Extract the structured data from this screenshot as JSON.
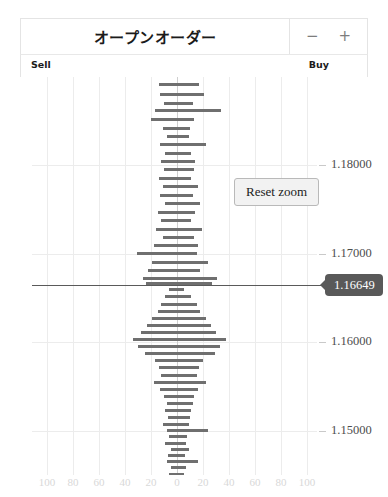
{
  "panel": {
    "title": "オープンオーダー",
    "zoom_out_label": "−",
    "zoom_in_label": "+"
  },
  "sides": {
    "sell_label": "Sell",
    "buy_label": "Buy"
  },
  "actions": {
    "reset_zoom_label": "Reset zoom"
  },
  "current_price": {
    "value": "1.16649",
    "badge_color": "#595959",
    "line_color": "#5a5a5a"
  },
  "chart_data": {
    "type": "bar",
    "orientation": "horizontal-diverging",
    "title": "オープンオーダー",
    "xlabel": "",
    "ylabel": "",
    "grid": true,
    "legend_position": "top",
    "bar_color": "#6f6f6f",
    "gridline_color": "#ececec",
    "ylim": [
      1.145,
      1.19
    ],
    "yticks": [
      "1.18000",
      "1.17000",
      "1.16000",
      "1.15000"
    ],
    "ytick_values": [
      1.18,
      1.17,
      1.16,
      1.15
    ],
    "xlim": [
      -100,
      100
    ],
    "xticks": [
      "100",
      "80",
      "60",
      "40",
      "20",
      "0",
      "20",
      "40",
      "60",
      "80",
      "100"
    ],
    "center_value": 1.16649,
    "series": [
      {
        "name": "Sell",
        "direction": "left"
      },
      {
        "name": "Buy",
        "direction": "right"
      }
    ],
    "bars": [
      {
        "price": 1.1892,
        "sell": 14,
        "buy": 17
      },
      {
        "price": 1.188,
        "sell": 13,
        "buy": 21
      },
      {
        "price": 1.187,
        "sell": 10,
        "buy": 12
      },
      {
        "price": 1.1862,
        "sell": 17,
        "buy": 34
      },
      {
        "price": 1.1852,
        "sell": 20,
        "buy": 13
      },
      {
        "price": 1.1842,
        "sell": 11,
        "buy": 10
      },
      {
        "price": 1.1833,
        "sell": 8,
        "buy": 9
      },
      {
        "price": 1.1824,
        "sell": 13,
        "buy": 22
      },
      {
        "price": 1.1814,
        "sell": 9,
        "buy": 11
      },
      {
        "price": 1.1804,
        "sell": 12,
        "buy": 14
      },
      {
        "price": 1.1795,
        "sell": 10,
        "buy": 13
      },
      {
        "price": 1.1785,
        "sell": 14,
        "buy": 11
      },
      {
        "price": 1.1776,
        "sell": 11,
        "buy": 16
      },
      {
        "price": 1.1766,
        "sell": 13,
        "buy": 12
      },
      {
        "price": 1.1757,
        "sell": 9,
        "buy": 18
      },
      {
        "price": 1.1747,
        "sell": 15,
        "buy": 14
      },
      {
        "price": 1.1738,
        "sell": 12,
        "buy": 11
      },
      {
        "price": 1.1728,
        "sell": 16,
        "buy": 19
      },
      {
        "price": 1.1719,
        "sell": 11,
        "buy": 13
      },
      {
        "price": 1.1709,
        "sell": 18,
        "buy": 16
      },
      {
        "price": 1.17,
        "sell": 31,
        "buy": 15
      },
      {
        "price": 1.169,
        "sell": 19,
        "buy": 24
      },
      {
        "price": 1.1681,
        "sell": 22,
        "buy": 18
      },
      {
        "price": 1.1672,
        "sell": 26,
        "buy": 31
      },
      {
        "price": 1.1666,
        "sell": 24,
        "buy": 27
      },
      {
        "price": 1.166,
        "sell": 6,
        "buy": 5
      },
      {
        "price": 1.1652,
        "sell": 9,
        "buy": 11
      },
      {
        "price": 1.1643,
        "sell": 12,
        "buy": 15
      },
      {
        "price": 1.1635,
        "sell": 15,
        "buy": 18
      },
      {
        "price": 1.1627,
        "sell": 19,
        "buy": 22
      },
      {
        "price": 1.1619,
        "sell": 23,
        "buy": 26
      },
      {
        "price": 1.1611,
        "sell": 28,
        "buy": 30
      },
      {
        "price": 1.1603,
        "sell": 34,
        "buy": 38
      },
      {
        "price": 1.1595,
        "sell": 30,
        "buy": 33
      },
      {
        "price": 1.1587,
        "sell": 25,
        "buy": 29
      },
      {
        "price": 1.1579,
        "sell": 17,
        "buy": 20
      },
      {
        "price": 1.1571,
        "sell": 14,
        "buy": 17
      },
      {
        "price": 1.1563,
        "sell": 12,
        "buy": 15
      },
      {
        "price": 1.1555,
        "sell": 18,
        "buy": 22
      },
      {
        "price": 1.1547,
        "sell": 13,
        "buy": 16
      },
      {
        "price": 1.1539,
        "sell": 10,
        "buy": 13
      },
      {
        "price": 1.1531,
        "sell": 8,
        "buy": 12
      },
      {
        "price": 1.1523,
        "sell": 9,
        "buy": 11
      },
      {
        "price": 1.1515,
        "sell": 7,
        "buy": 10
      },
      {
        "price": 1.1507,
        "sell": 11,
        "buy": 9
      },
      {
        "price": 1.15,
        "sell": 8,
        "buy": 24
      },
      {
        "price": 1.1493,
        "sell": 6,
        "buy": 8
      },
      {
        "price": 1.1486,
        "sell": 9,
        "buy": 7
      },
      {
        "price": 1.1479,
        "sell": 5,
        "buy": 9
      },
      {
        "price": 1.1472,
        "sell": 7,
        "buy": 6
      },
      {
        "price": 1.1465,
        "sell": 8,
        "buy": 16
      },
      {
        "price": 1.1458,
        "sell": 5,
        "buy": 7
      },
      {
        "price": 1.1451,
        "sell": 6,
        "buy": 5
      },
      {
        "price": 1.1444,
        "sell": 4,
        "buy": 6
      },
      {
        "price": 1.1437,
        "sell": 5,
        "buy": 4
      }
    ]
  }
}
